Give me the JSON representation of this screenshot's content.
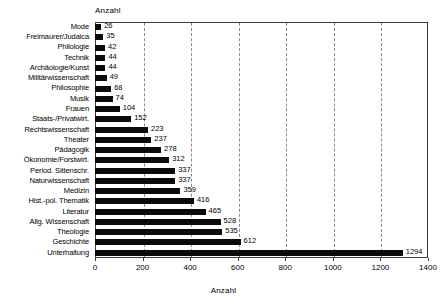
{
  "chart_data": {
    "type": "bar",
    "orientation": "horizontal",
    "title": "",
    "top_axis_label": "Anzahl",
    "xlabel": "Anzahl",
    "ylabel": "",
    "xlim": [
      0,
      1400
    ],
    "xticks": [
      0,
      200,
      400,
      600,
      800,
      1000,
      1200,
      1400
    ],
    "xtick_labels": [
      "0",
      "200",
      "400",
      "600",
      "800",
      "1000",
      "1200",
      "1400"
    ],
    "grid": "vertical-dashed",
    "legend": "none",
    "bar_color": "#0b0b0b",
    "categories": [
      "Mode",
      "Freimaurer/Judaica",
      "Philologie",
      "Technik",
      "Archäologie/Kunst",
      "Militärwissenschaft",
      "Philosophie",
      "Musik",
      "Frauen",
      "Staats-/Privatwirt.",
      "Rechtswissenschaft",
      "Theater",
      "Pädagogik",
      "Ökonomie/Forstwirt.",
      "Period. Sittenschr.",
      "Naturwissenschaft",
      "Medizin",
      "Hist.-pol. Thematik",
      "Literatur",
      "Allg. Wissenschaft",
      "Theologie",
      "Geschichte",
      "Unterhaltung"
    ],
    "values": [
      26,
      35,
      42,
      44,
      44,
      49,
      68,
      74,
      104,
      152,
      223,
      237,
      278,
      312,
      337,
      337,
      359,
      416,
      465,
      528,
      535,
      612,
      1294
    ],
    "value_labels": [
      "26",
      "35",
      "42",
      "44",
      "44",
      "49",
      "68",
      "74",
      "104",
      "152",
      "223",
      "237",
      "278",
      "312",
      "337",
      "337",
      "359",
      "416",
      "465",
      "528",
      "535",
      "612",
      "1294"
    ]
  }
}
